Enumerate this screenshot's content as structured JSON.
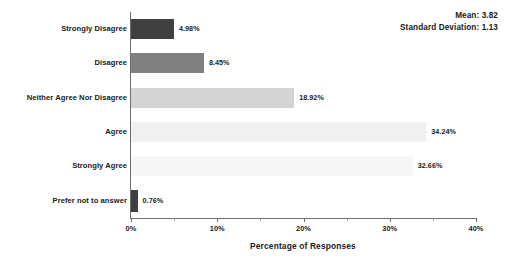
{
  "chart_data": {
    "type": "bar",
    "orientation": "horizontal",
    "title": "",
    "xlabel": "Percentage of Responses",
    "ylabel": "",
    "categories": [
      "Strongly Disagree",
      "Disagree",
      "Neither Agree Nor Disagree",
      "Agree",
      "Strongly Agree",
      "Prefer not to answer"
    ],
    "values": [
      4.98,
      8.45,
      18.92,
      34.24,
      32.66,
      0.76
    ],
    "value_labels": [
      "4.98%",
      "8.45%",
      "18.92%",
      "34.24%",
      "32.66%",
      "0.76%"
    ],
    "bar_colors": [
      "#404040",
      "#808080",
      "#d4d4d4",
      "#f0f0f0",
      "#f7f7f7",
      "#404040"
    ],
    "xlim": [
      0,
      40
    ],
    "xticks": [
      0,
      10,
      20,
      30,
      40
    ],
    "xtick_labels": [
      "0%",
      "10%",
      "20%",
      "30%",
      "40%"
    ],
    "xminor_ticks": [
      5,
      15,
      25,
      35
    ],
    "grid": false,
    "legend": null
  },
  "annotations": {
    "mean_label": "Mean: 3.82",
    "std_label": "Standard Deviation: 1.13"
  }
}
